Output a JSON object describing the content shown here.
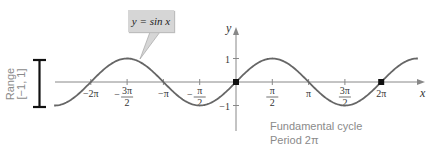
{
  "chart_data": {
    "type": "line",
    "title": "",
    "function_label": "y = sin x",
    "xlabel": "x",
    "ylabel": "y",
    "x_ticks": [
      {
        "value": -6.2832,
        "label_num": "−2π",
        "label_den": ""
      },
      {
        "value": -4.7124,
        "label_num": "3π",
        "label_den": "2",
        "sign": "−"
      },
      {
        "value": -3.1416,
        "label_num": "−π",
        "label_den": ""
      },
      {
        "value": -1.5708,
        "label_num": "π",
        "label_den": "2",
        "sign": "−"
      },
      {
        "value": 1.5708,
        "label_num": "π",
        "label_den": "2"
      },
      {
        "value": 3.1416,
        "label_num": "π",
        "label_den": ""
      },
      {
        "value": 4.7124,
        "label_num": "3π",
        "label_den": "2"
      },
      {
        "value": 6.2832,
        "label_num": "2π",
        "label_den": ""
      }
    ],
    "y_ticks": [
      {
        "value": 1,
        "label": "1"
      },
      {
        "value": -1,
        "label": "−1"
      }
    ],
    "xlim": [
      -7.87,
      7.87
    ],
    "ylim": [
      -1,
      1
    ],
    "highlighted_points": [
      [
        0,
        0
      ],
      [
        6.2832,
        0
      ]
    ],
    "grid": false,
    "annotations": {
      "range_label": "Range",
      "range_value": "[−1, 1]",
      "caption_line1": "Fundamental cycle",
      "caption_line2": "Period 2π"
    },
    "colors": {
      "curve": "#666666",
      "axis": "#888888",
      "point": "#111111",
      "bracket": "#111111"
    }
  }
}
